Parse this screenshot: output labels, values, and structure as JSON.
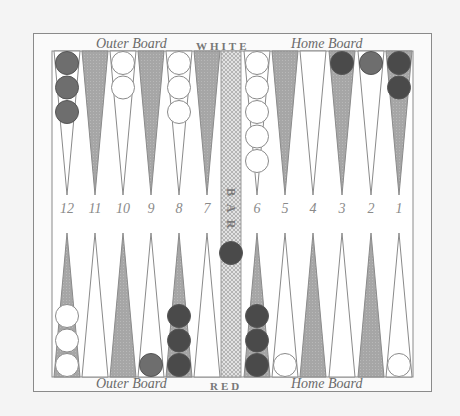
{
  "board": {
    "top_labels": {
      "outer": "Outer Board",
      "player": "WHITE",
      "home": "Home Board"
    },
    "bottom_labels": {
      "outer": "Outer Board",
      "player": "RED",
      "home": "Home Board"
    },
    "bar_label": "BAR",
    "point_numbers": [
      "12",
      "11",
      "10",
      "9",
      "8",
      "7",
      "6",
      "5",
      "4",
      "3",
      "2",
      "1"
    ],
    "colors": {
      "frame": "#8a8a8a",
      "dark_point": "#a8a8a8",
      "light_point": "#ffffff",
      "white_checker": "#ffffff",
      "red_checker": "#6e6e6e",
      "dark_checker": "#4a4a4a",
      "bar": "#d8d8d8"
    },
    "top_points": [
      {
        "number": "12",
        "checkers": [
          "red",
          "red",
          "red"
        ]
      },
      {
        "number": "11",
        "checkers": []
      },
      {
        "number": "10",
        "checkers": [
          "white",
          "white"
        ]
      },
      {
        "number": "9",
        "checkers": []
      },
      {
        "number": "8",
        "checkers": [
          "white",
          "white",
          "white"
        ]
      },
      {
        "number": "7",
        "checkers": []
      },
      {
        "number": "6",
        "checkers": [
          "white",
          "white",
          "white",
          "white",
          "white"
        ]
      },
      {
        "number": "5",
        "checkers": []
      },
      {
        "number": "4",
        "checkers": []
      },
      {
        "number": "3",
        "checkers": [
          "dark"
        ]
      },
      {
        "number": "2",
        "checkers": [
          "red"
        ]
      },
      {
        "number": "1",
        "checkers": [
          "dark",
          "dark"
        ]
      }
    ],
    "bottom_points": [
      {
        "position": 1,
        "checkers": [
          "white",
          "white",
          "white"
        ]
      },
      {
        "position": 2,
        "checkers": []
      },
      {
        "position": 3,
        "checkers": []
      },
      {
        "position": 4,
        "checkers": [
          "red"
        ]
      },
      {
        "position": 5,
        "checkers": [
          "dark",
          "dark",
          "dark"
        ]
      },
      {
        "position": 6,
        "checkers": []
      },
      {
        "position": 7,
        "checkers": [
          "dark",
          "dark",
          "dark"
        ]
      },
      {
        "position": 8,
        "checkers": [
          "white"
        ]
      },
      {
        "position": 9,
        "checkers": []
      },
      {
        "position": 10,
        "checkers": []
      },
      {
        "position": 11,
        "checkers": []
      },
      {
        "position": 12,
        "checkers": [
          "white"
        ]
      }
    ],
    "bar_checkers": [
      "dark"
    ]
  }
}
